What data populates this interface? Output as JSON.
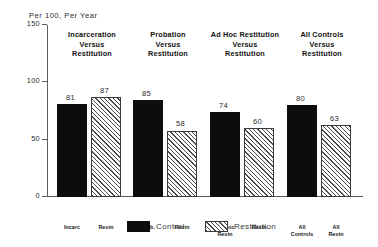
{
  "chart_data": {
    "type": "bar",
    "title": "Per 100, Per Year",
    "xlabel": "",
    "ylabel": "",
    "ylim": [
      0,
      150
    ],
    "yticks": [
      0,
      50,
      100,
      150
    ],
    "grid": false,
    "legend_position": "bottom",
    "categories": [
      "Incarceration Versus Restitution",
      "Probation Versus Restitution",
      "Ad Hoc Restitution Versus Restitution",
      "All Controls Versus Restitution"
    ],
    "series": [
      {
        "name": "Control",
        "values": [
          81,
          85,
          74,
          80
        ],
        "color": "#0d0d0d"
      },
      {
        "name": "Restitution",
        "values": [
          87,
          58,
          60,
          63
        ],
        "color": "#ffffff"
      }
    ],
    "groups": [
      {
        "header_lines": [
          "Incarceration",
          "Versus",
          "Restitution"
        ],
        "bars": [
          {
            "series": "Control",
            "value": 81,
            "value_label": "81",
            "tick_lines": [
              "Incarc"
            ]
          },
          {
            "series": "Restitution",
            "value": 87,
            "value_label": "87",
            "tick_lines": [
              "Restn"
            ]
          }
        ]
      },
      {
        "header_lines": [
          "Probation",
          "Versus",
          "Restitution"
        ],
        "bars": [
          {
            "series": "Control",
            "value": 85,
            "value_label": "85",
            "tick_lines": [
              "Prob."
            ]
          },
          {
            "series": "Restitution",
            "value": 58,
            "value_label": "58",
            "tick_lines": [
              "Restn"
            ]
          }
        ]
      },
      {
        "header_lines": [
          "Ad Hoc Restitution",
          "Versus",
          "Restitution"
        ],
        "bars": [
          {
            "series": "Control",
            "value": 74,
            "value_label": "74",
            "tick_lines": [
              "Ad Hoc",
              "Restn"
            ]
          },
          {
            "series": "Restitution",
            "value": 60,
            "value_label": "60",
            "tick_lines": [
              "Restn"
            ]
          }
        ]
      },
      {
        "header_lines": [
          "All Controls",
          "Versus",
          "Restitution"
        ],
        "bars": [
          {
            "series": "Control",
            "value": 80,
            "value_label": "80",
            "tick_lines": [
              "All",
              "Controls"
            ]
          },
          {
            "series": "Restitution",
            "value": 63,
            "value_label": "63",
            "tick_lines": [
              "All",
              "Restn"
            ]
          }
        ]
      }
    ]
  },
  "axis": {
    "title": "Per 100, Per Year",
    "tick_labels": [
      "150",
      "100",
      "50",
      "0"
    ]
  },
  "legend": {
    "items": [
      {
        "label": "Control",
        "style": "control"
      },
      {
        "label": "Restitution",
        "style": "restitution"
      }
    ]
  }
}
